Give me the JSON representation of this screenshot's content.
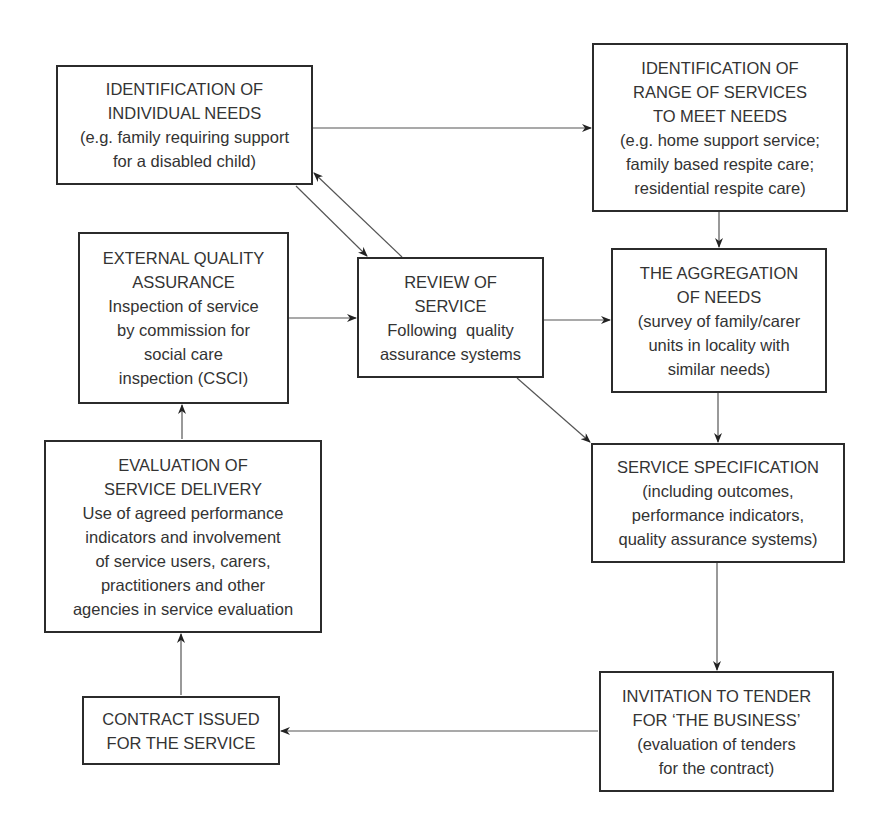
{
  "diagram": {
    "type": "flowchart",
    "colors": {
      "border": "#2b2b2b",
      "text": "#333333",
      "arrow": "#555555",
      "background": "#ffffff"
    },
    "nodes": {
      "individual_needs": {
        "lines": [
          "IDENTIFICATION OF",
          "INDIVIDUAL NEEDS",
          "(e.g. family requiring support",
          "for a disabled child)"
        ]
      },
      "range_of_services": {
        "lines": [
          "IDENTIFICATION OF",
          "RANGE OF SERVICES",
          "TO MEET NEEDS",
          "(e.g. home support service;",
          "family based respite care;",
          "residential respite care)"
        ]
      },
      "external_qa": {
        "lines": [
          "EXTERNAL QUALITY",
          "ASSURANCE",
          "Inspection of service",
          "by commission for",
          "social care",
          "inspection (CSCI)"
        ]
      },
      "review": {
        "lines": [
          "REVIEW OF",
          "SERVICE",
          "Following  quality",
          "assurance systems"
        ]
      },
      "aggregation": {
        "lines": [
          "THE AGGREGATION",
          "OF NEEDS",
          "(survey of family/carer",
          "units in locality with",
          "similar needs)"
        ]
      },
      "evaluation": {
        "lines": [
          "EVALUATION OF",
          "SERVICE DELIVERY",
          "Use of agreed performance",
          "indicators and involvement",
          "of service users, carers,",
          "practitioners and other",
          "agencies in service evaluation"
        ]
      },
      "specification": {
        "lines": [
          "SERVICE SPECIFICATION",
          "(including outcomes,",
          "performance indicators,",
          "quality assurance systems)"
        ]
      },
      "contract": {
        "lines": [
          "CONTRACT ISSUED",
          "FOR THE SERVICE"
        ]
      },
      "tender": {
        "lines": [
          "INVITATION TO TENDER",
          "FOR ‘THE BUSINESS’",
          "(evaluation of tenders",
          "for the contract)"
        ]
      }
    },
    "edges": [
      {
        "from": "individual_needs",
        "to": "range_of_services"
      },
      {
        "from": "range_of_services",
        "to": "aggregation"
      },
      {
        "from": "individual_needs",
        "to": "review"
      },
      {
        "from": "review",
        "to": "individual_needs"
      },
      {
        "from": "external_qa",
        "to": "review"
      },
      {
        "from": "review",
        "to": "aggregation"
      },
      {
        "from": "review",
        "to": "specification"
      },
      {
        "from": "aggregation",
        "to": "specification"
      },
      {
        "from": "specification",
        "to": "tender"
      },
      {
        "from": "tender",
        "to": "contract"
      },
      {
        "from": "contract",
        "to": "evaluation"
      },
      {
        "from": "evaluation",
        "to": "external_qa"
      }
    ]
  }
}
